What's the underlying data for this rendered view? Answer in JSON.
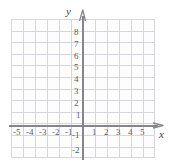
{
  "diagram": {
    "type": "cartesian-coordinate-plane",
    "title": "",
    "axis_labels": {
      "x": "x",
      "y": "y"
    },
    "icons": {
      "x_arrow": "arrow-right-icon",
      "y_arrow": "arrow-up-icon"
    },
    "colors": {
      "background": "#ffffff",
      "grid_line": "#d6d6dc",
      "axis_line": "#85858c",
      "tick_label": "#5b5b61",
      "axis_label": "#3d3d44"
    },
    "grid": {
      "visible": true,
      "columns": 12,
      "rows": 12,
      "cell_size_px": 12
    },
    "x_axis": {
      "negative_ticks": [
        "-5",
        "-4",
        "-3",
        "-2",
        "-1"
      ],
      "positive_ticks": [
        "1",
        "2",
        "3",
        "4",
        "5"
      ],
      "range": [
        -6,
        6
      ]
    },
    "y_axis": {
      "positive_ticks": [
        "8",
        "7",
        "6",
        "5",
        "4",
        "3",
        "2",
        "1"
      ],
      "negative_ticks": [
        "-1",
        "-2"
      ],
      "range": [
        -3,
        9
      ]
    },
    "data_points": [],
    "curves": []
  }
}
